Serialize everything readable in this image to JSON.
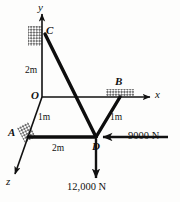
{
  "figure": {
    "type": "engineering-statics-free-body-diagram",
    "axes": [
      {
        "name": "y-axis",
        "label": "y",
        "direction": "up"
      },
      {
        "name": "x-axis",
        "label": "x",
        "direction": "right"
      },
      {
        "name": "z-axis",
        "label": "z",
        "direction": "down-left"
      }
    ],
    "origin_label": "O",
    "joints": [
      {
        "name": "C",
        "label": "C",
        "support": "fixed-hatched",
        "location": "on y-axis above origin"
      },
      {
        "name": "B",
        "label": "B",
        "support": "fixed-hatched",
        "location": "on x-axis right of origin"
      },
      {
        "name": "A",
        "label": "A",
        "support": "fixed-hatched",
        "location": "on z-axis below origin"
      },
      {
        "name": "D",
        "label": "D",
        "support": "none",
        "location": "loaded joint"
      }
    ],
    "dimensions": [
      {
        "name": "OC",
        "label": "2m",
        "from": "O",
        "to": "C"
      },
      {
        "name": "OA",
        "label": "1m",
        "from": "O",
        "to": "A"
      },
      {
        "name": "BD",
        "label": "1m",
        "from": "B",
        "to": "D"
      },
      {
        "name": "AD",
        "label": "2m",
        "from": "A",
        "to": "D"
      }
    ],
    "forces": [
      {
        "name": "horizontal-load",
        "label": "9000 N",
        "magnitude": 9000,
        "unit": "N",
        "direction": "negative-x (pointing left)",
        "applied_at": "D"
      },
      {
        "name": "vertical-load",
        "label": "12,000 N",
        "magnitude": 12000,
        "unit": "N",
        "direction": "negative-y (pointing down)",
        "applied_at": "D"
      }
    ],
    "colors": {
      "line": "#111111",
      "member": "#0d0d0d",
      "background": "#fdfdfc",
      "hatch": "#7a7a7a"
    }
  }
}
